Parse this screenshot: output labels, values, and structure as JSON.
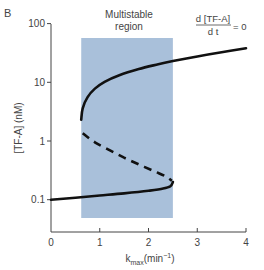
{
  "panel_label": "B",
  "region_label": {
    "line1": "Multistable",
    "line2": "region"
  },
  "equation": {
    "numerator": "d [TF-A]",
    "denominator": "d t",
    "rhs": "= 0"
  },
  "colors": {
    "region": "#a9c0da",
    "curve": "#111111",
    "axis": "#444444"
  },
  "chart_data": {
    "type": "line",
    "title": "",
    "panel": "B",
    "xlabel": "k_max (min^-1)",
    "ylabel": "[TF-A] (nM)",
    "xlim": [
      0,
      4
    ],
    "ylim": [
      0.05,
      100
    ],
    "yscale": "log",
    "xticks": [
      0,
      1,
      2,
      3,
      4
    ],
    "yticks": [
      0.1,
      1,
      10,
      100
    ],
    "ytick_labels": [
      "0.1",
      "1",
      "10",
      "100"
    ],
    "grid": false,
    "annotations": [
      "Multistable region",
      "d[TF-A]/dt = 0"
    ],
    "shaded_region": {
      "label": "Multistable region",
      "x_range": [
        0.62,
        2.5
      ]
    },
    "series": [
      {
        "name": "upper stable branch",
        "style": "solid",
        "x": [
          0.62,
          0.65,
          0.75,
          0.9,
          1.1,
          1.4,
          1.8,
          2.2,
          2.5,
          3.0,
          3.5,
          4.0
        ],
        "y": [
          2.3,
          3.6,
          5.6,
          7.8,
          10.2,
          13.2,
          16.8,
          20.3,
          23.0,
          27.5,
          32.5,
          38.0
        ]
      },
      {
        "name": "unstable branch",
        "style": "dashed",
        "x": [
          0.65,
          0.9,
          1.2,
          1.5,
          1.8,
          2.1,
          2.35,
          2.48
        ],
        "y": [
          1.35,
          0.95,
          0.7,
          0.52,
          0.4,
          0.31,
          0.25,
          0.21
        ]
      },
      {
        "name": "lower stable branch",
        "style": "solid",
        "x": [
          0.0,
          0.5,
          1.0,
          1.5,
          2.0,
          2.3,
          2.45,
          2.5
        ],
        "y": [
          0.1,
          0.108,
          0.118,
          0.128,
          0.142,
          0.155,
          0.17,
          0.2
        ]
      }
    ]
  }
}
